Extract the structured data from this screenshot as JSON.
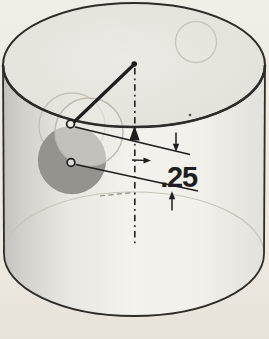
{
  "figure": {
    "dimension_label": ".25"
  },
  "colors": {
    "paper": "#eeeae2",
    "ink": "#1e1e1e",
    "outline": "#2e2c29",
    "sphere": "#94938d",
    "ghost": "#bcb9b0",
    "faint": "#c8c5bb"
  }
}
